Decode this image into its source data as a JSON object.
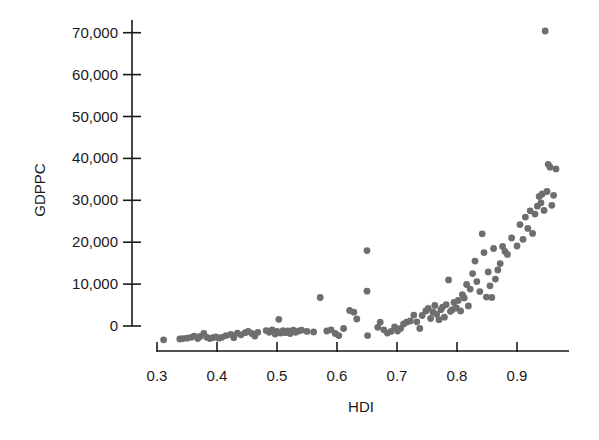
{
  "chart_data": {
    "type": "scatter",
    "title": "",
    "xlabel": "HDI",
    "ylabel": "GDPPC",
    "xlim": [
      0.3,
      0.985
    ],
    "ylim": [
      0,
      70000
    ],
    "x_ticks": [
      0.3,
      0.4,
      0.5,
      0.6,
      0.7,
      0.8,
      0.9
    ],
    "x_tick_labels": [
      "0.3",
      "0.4",
      "0.5",
      "0.6",
      "0.7",
      "0.8",
      "0.9"
    ],
    "y_ticks": [
      0,
      10000,
      20000,
      30000,
      40000,
      50000,
      60000,
      70000
    ],
    "y_tick_labels": [
      "0",
      "10,000",
      "20,000",
      "30,000",
      "40,000",
      "50,000",
      "60,000",
      "70,000"
    ],
    "grid": false,
    "legend": null,
    "marker_color": "#6e6e6e",
    "series": [
      {
        "name": "Countries",
        "points": [
          [
            0.311,
            -3300
          ],
          [
            0.338,
            -3100
          ],
          [
            0.343,
            -3000
          ],
          [
            0.35,
            -2900
          ],
          [
            0.357,
            -2700
          ],
          [
            0.362,
            -2400
          ],
          [
            0.368,
            -3000
          ],
          [
            0.372,
            -2500
          ],
          [
            0.378,
            -1800
          ],
          [
            0.383,
            -2700
          ],
          [
            0.388,
            -3000
          ],
          [
            0.393,
            -2800
          ],
          [
            0.398,
            -2600
          ],
          [
            0.403,
            -2900
          ],
          [
            0.408,
            -2700
          ],
          [
            0.415,
            -2300
          ],
          [
            0.423,
            -2000
          ],
          [
            0.428,
            -2800
          ],
          [
            0.434,
            -1700
          ],
          [
            0.44,
            -2100
          ],
          [
            0.447,
            -1600
          ],
          [
            0.452,
            -1300
          ],
          [
            0.458,
            -1800
          ],
          [
            0.463,
            -2400
          ],
          [
            0.468,
            -1500
          ],
          [
            0.482,
            -1100
          ],
          [
            0.487,
            -1500
          ],
          [
            0.492,
            -900
          ],
          [
            0.497,
            -1900
          ],
          [
            0.5,
            -1300
          ],
          [
            0.503,
            1600
          ],
          [
            0.506,
            -1700
          ],
          [
            0.51,
            -1100
          ],
          [
            0.514,
            -1600
          ],
          [
            0.518,
            -1200
          ],
          [
            0.522,
            -1800
          ],
          [
            0.527,
            -1000
          ],
          [
            0.531,
            -1500
          ],
          [
            0.536,
            -1200
          ],
          [
            0.541,
            -1000
          ],
          [
            0.55,
            -1300
          ],
          [
            0.561,
            -1400
          ],
          [
            0.572,
            6800
          ],
          [
            0.583,
            -1200
          ],
          [
            0.59,
            -900
          ],
          [
            0.597,
            -1800
          ],
          [
            0.603,
            -2300
          ],
          [
            0.611,
            -600
          ],
          [
            0.621,
            3700
          ],
          [
            0.628,
            3300
          ],
          [
            0.633,
            1700
          ],
          [
            0.65,
            18000
          ],
          [
            0.65,
            8300
          ],
          [
            0.651,
            -2300
          ],
          [
            0.668,
            -300
          ],
          [
            0.672,
            900
          ],
          [
            0.678,
            -900
          ],
          [
            0.684,
            -1700
          ],
          [
            0.69,
            -1300
          ],
          [
            0.696,
            -200
          ],
          [
            0.701,
            -1200
          ],
          [
            0.706,
            -600
          ],
          [
            0.711,
            500
          ],
          [
            0.716,
            900
          ],
          [
            0.722,
            1200
          ],
          [
            0.728,
            2600
          ],
          [
            0.733,
            1000
          ],
          [
            0.738,
            -600
          ],
          [
            0.742,
            2500
          ],
          [
            0.748,
            3600
          ],
          [
            0.752,
            4200
          ],
          [
            0.756,
            1800
          ],
          [
            0.76,
            3300
          ],
          [
            0.763,
            4900
          ],
          [
            0.766,
            2800
          ],
          [
            0.77,
            1500
          ],
          [
            0.773,
            3900
          ],
          [
            0.776,
            4500
          ],
          [
            0.779,
            2100
          ],
          [
            0.782,
            5100
          ],
          [
            0.786,
            11000
          ],
          [
            0.789,
            3500
          ],
          [
            0.792,
            3900
          ],
          [
            0.795,
            5600
          ],
          [
            0.799,
            4300
          ],
          [
            0.802,
            6100
          ],
          [
            0.806,
            3600
          ],
          [
            0.809,
            7500
          ],
          [
            0.812,
            6700
          ],
          [
            0.816,
            9900
          ],
          [
            0.819,
            4800
          ],
          [
            0.822,
            8800
          ],
          [
            0.826,
            12500
          ],
          [
            0.83,
            15500
          ],
          [
            0.833,
            10600
          ],
          [
            0.838,
            8200
          ],
          [
            0.842,
            22000
          ],
          [
            0.845,
            17500
          ],
          [
            0.849,
            6900
          ],
          [
            0.852,
            12900
          ],
          [
            0.855,
            9600
          ],
          [
            0.858,
            6800
          ],
          [
            0.861,
            18500
          ],
          [
            0.864,
            11200
          ],
          [
            0.868,
            13400
          ],
          [
            0.872,
            14900
          ],
          [
            0.876,
            19000
          ],
          [
            0.88,
            17800
          ],
          [
            0.884,
            17100
          ],
          [
            0.891,
            21000
          ],
          [
            0.9,
            19100
          ],
          [
            0.905,
            24200
          ],
          [
            0.91,
            20700
          ],
          [
            0.914,
            26000
          ],
          [
            0.918,
            23300
          ],
          [
            0.922,
            27500
          ],
          [
            0.926,
            22100
          ],
          [
            0.93,
            26700
          ],
          [
            0.934,
            28600
          ],
          [
            0.937,
            30900
          ],
          [
            0.94,
            29400
          ],
          [
            0.942,
            31500
          ],
          [
            0.945,
            27600
          ],
          [
            0.947,
            70400
          ],
          [
            0.95,
            32100
          ],
          [
            0.952,
            38600
          ],
          [
            0.955,
            37900
          ],
          [
            0.958,
            28800
          ],
          [
            0.961,
            31200
          ],
          [
            0.965,
            37500
          ]
        ]
      }
    ]
  },
  "plot_geometry": {
    "y_axis_x": 132,
    "x_axis_y": 351,
    "y0_px": 326,
    "px_per_10000": 41.9,
    "x_start_px": 157,
    "px_per_0_1": 60,
    "x_axis_end_px": 569,
    "y_axis_top_px": 20
  }
}
